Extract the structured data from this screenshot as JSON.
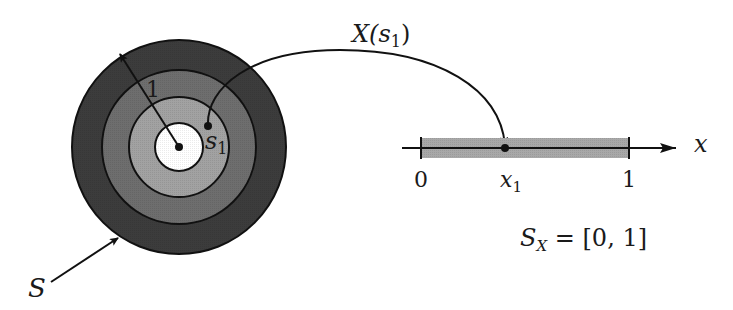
{
  "diagram": {
    "type": "random-variable-mapping",
    "colors": {
      "background": "#ffffff",
      "ring_outer": "#3c3c3c",
      "ring_second": "#6a6a6a",
      "ring_third": "#9e9e9e",
      "ring_inner": "#ffffff",
      "stroke": "#111111",
      "interval_fill": "#a8a8a8"
    },
    "sample_space": {
      "label": "S",
      "radius_label": "1",
      "point_label": "s",
      "point_subscript": "1",
      "center": [
        179,
        147
      ],
      "ring_radii": [
        107,
        77,
        50,
        24
      ]
    },
    "mapping": {
      "label_prefix": "X(",
      "label_var": "s",
      "label_subscript": "1",
      "label_suffix": ")"
    },
    "real_line": {
      "axis_label": "x",
      "tick_labels": [
        "0",
        "1"
      ],
      "point_label": "x",
      "point_subscript": "1",
      "range_label_prefix": "S",
      "range_label_subscript": "X",
      "range_label_suffix": " = [0, 1]"
    }
  }
}
